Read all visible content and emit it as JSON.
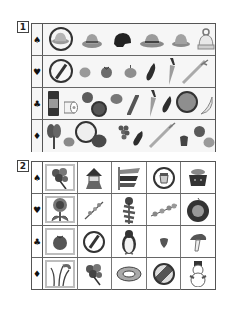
{
  "sections": [
    {
      "label": "1",
      "rows": [
        {
          "suit": "♠",
          "suit_name": "spade",
          "items": [
            "circled-hat",
            "brimmed-hat",
            "black-helmet",
            "fedora-hat",
            "bucket-hat",
            "knit-cap"
          ]
        },
        {
          "suit": "♥",
          "suit_name": "heart",
          "items": [
            "crossed-out-circle",
            "potato",
            "tomato",
            "onion",
            "eggplant",
            "carrot",
            "green-onion"
          ]
        },
        {
          "suit": "♣",
          "suit_name": "club",
          "items": [
            "jar",
            "toilet-paper",
            "tomato",
            "circled-plate",
            "onion",
            "cucumber",
            "carrot",
            "eggplant",
            "circled-grapes",
            "banana"
          ]
        },
        {
          "suit": "♦",
          "suit_name": "diamond",
          "items": [
            "spinach",
            "onion",
            "circled-toilet-paper",
            "pumpkin",
            "grapes",
            "eggplant",
            "green-onion",
            "bell-pepper",
            "tomato",
            "potato"
          ]
        }
      ]
    },
    {
      "label": "2",
      "rows": [
        {
          "suit": "♠",
          "suit_name": "spade",
          "cells": [
            "flower-bouquet",
            "kabuto-doll",
            "koinobori-carp-streamers",
            "circled-pudding",
            "kagami-mochi"
          ]
        },
        {
          "suit": "♥",
          "suit_name": "heart",
          "cells": [
            "sunflower",
            "plum-blossom-branch",
            "tanabata-bamboo",
            "cherry-blossom-branch",
            "autumn-wreath"
          ]
        },
        {
          "suit": "♣",
          "suit_name": "club",
          "cells": [
            "tomato",
            "crossed-out-circle",
            "penguin",
            "strawberry",
            "mushroom"
          ]
        },
        {
          "suit": "♦",
          "suit_name": "diamond",
          "cells": [
            "pampas-grass",
            "flower-bouquet",
            "swim-ring",
            "beach-ball",
            "snowman"
          ]
        }
      ]
    }
  ],
  "colors": {
    "border": "#555555",
    "row_bg": "#f6f6f6",
    "highlight_border": "#bdbdbd",
    "ink": "#222222"
  }
}
